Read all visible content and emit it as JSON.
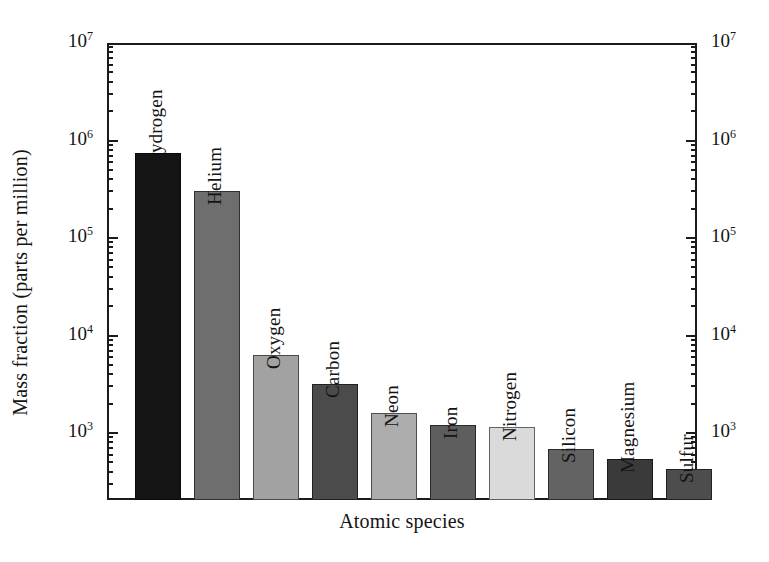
{
  "chart_data": {
    "type": "bar",
    "title": "",
    "xlabel": "Atomic species",
    "ylabel": "Mass fraction (parts per million)",
    "yscale": "log",
    "ylim": [
      204,
      10000000
    ],
    "grid": false,
    "legend": "none",
    "categories": [
      "Hydrogen",
      "Helium",
      "Oxygen",
      "Carbon",
      "Neon",
      "Iron",
      "Nitrogen",
      "Silicon",
      "Magnesium",
      "Sulfur"
    ],
    "values": [
      740000,
      300000,
      6300,
      3200,
      1600,
      1200,
      1150,
      690,
      540,
      430
    ],
    "bar_colors": [
      "#141414",
      "#6e6e6e",
      "#a2a2a2",
      "#4b4b4b",
      "#adadad",
      "#5e5e5e",
      "#dadada",
      "#636363",
      "#3a3a3a",
      "#4d4d4d"
    ],
    "y_ticks": [
      {
        "value": 10000000,
        "mantissa": "10",
        "exponent": "7"
      },
      {
        "value": 1000000,
        "mantissa": "10",
        "exponent": "6"
      },
      {
        "value": 100000,
        "mantissa": "10",
        "exponent": "5"
      },
      {
        "value": 10000,
        "mantissa": "10",
        "exponent": "4"
      },
      {
        "value": 1000,
        "mantissa": "10",
        "exponent": "3"
      }
    ]
  },
  "axes": {
    "y_title": "Mass fraction (parts per million)",
    "x_title": "Atomic species"
  },
  "labels": {
    "b0": "Hydrogen",
    "b1": "Helium",
    "b2": "Oxygen",
    "b3": "Carbon",
    "b4": "Neon",
    "b5": "Iron",
    "b6": "Nitrogen",
    "b7": "Silicon",
    "b8": "Magnesium",
    "b9": "Sulfur"
  }
}
